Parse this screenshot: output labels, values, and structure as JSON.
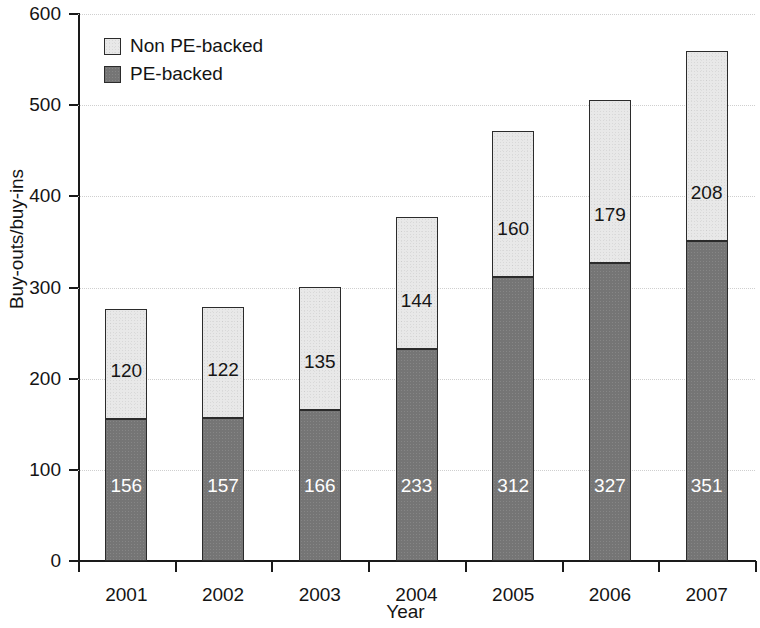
{
  "chart_data": {
    "type": "bar",
    "subtype": "stacked-bar",
    "title": "",
    "xlabel": "Year",
    "ylabel": "Buy-outs/buy-ins",
    "categories": [
      "2001",
      "2002",
      "2003",
      "2004",
      "2005",
      "2006",
      "2007"
    ],
    "series": [
      {
        "name": "PE-backed",
        "color": "#757575",
        "values": [
          156,
          157,
          166,
          233,
          312,
          327,
          351
        ]
      },
      {
        "name": "Non PE-backed",
        "color": "#e8e8e8",
        "values": [
          120,
          122,
          135,
          144,
          160,
          179,
          208
        ]
      }
    ],
    "totals": [
      276,
      279,
      301,
      377,
      472,
      506,
      559
    ],
    "ylim": [
      0,
      600
    ],
    "yticks": [
      0,
      100,
      200,
      300,
      400,
      500,
      600
    ],
    "ytick_labels": [
      "0",
      "100",
      "200",
      "300",
      "400",
      "500",
      "600"
    ],
    "grid": true,
    "grid_axis": "y",
    "legend_position": "top-left",
    "legend": [
      {
        "label": "Non PE-backed",
        "color": "#e8e8e8"
      },
      {
        "label": "PE-backed",
        "color": "#757575"
      }
    ],
    "data_labels": true
  }
}
